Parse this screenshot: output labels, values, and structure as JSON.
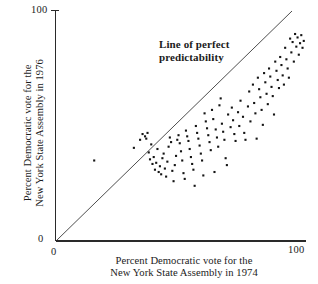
{
  "chart_data": {
    "type": "scatter",
    "title": "",
    "xlabel": "Percent Democratic vote for the New York State Assembly in 1974",
    "ylabel": "Percent Democratic vote for the New York State Assembly in 1976",
    "xlim": [
      0,
      100
    ],
    "ylim": [
      0,
      100
    ],
    "grid": false,
    "legend": false,
    "axis": {
      "x_ticks": [
        "0",
        "100"
      ],
      "x_tick_values": [
        0,
        100
      ],
      "y_ticks": [
        "0",
        "100"
      ],
      "y_tick_values": [
        0,
        100
      ]
    },
    "xlabel_lines": [
      "Percent Democratic vote for the",
      "New York State Assembly in 1974"
    ],
    "ylabel_lines": [
      "Percent Democratic vote for the",
      "New York State Assembly in 1976"
    ],
    "annotations": [
      {
        "text": "Line of perfect predictability",
        "lines": [
          "Line of perfect",
          "predictability"
        ],
        "x": 41,
        "y": 84
      }
    ],
    "reference_line": {
      "name": "line of perfect predictability",
      "type": "identity",
      "slope": 1,
      "intercept": 0,
      "from": [
        0,
        0
      ],
      "to": [
        95,
        100
      ]
    },
    "marker": {
      "shape": "square",
      "color": "#141414",
      "size_px": 2.1
    },
    "n_points": 128,
    "points": [
      [
        15.0,
        35.0
      ],
      [
        31.0,
        40.5
      ],
      [
        33.5,
        44.0
      ],
      [
        34.5,
        46.5
      ],
      [
        35.5,
        45.5
      ],
      [
        36.0,
        44.5
      ],
      [
        36.5,
        47.0
      ],
      [
        37.0,
        38.5
      ],
      [
        37.5,
        35.5
      ],
      [
        38.0,
        42.0
      ],
      [
        38.5,
        33.5
      ],
      [
        39.0,
        36.5
      ],
      [
        39.5,
        31.0
      ],
      [
        40.0,
        34.0
      ],
      [
        40.5,
        40.0
      ],
      [
        41.0,
        30.0
      ],
      [
        41.5,
        32.5
      ],
      [
        42.0,
        29.0
      ],
      [
        42.5,
        36.0
      ],
      [
        43.0,
        38.0
      ],
      [
        43.5,
        31.5
      ],
      [
        44.0,
        28.0
      ],
      [
        44.5,
        34.5
      ],
      [
        45.0,
        41.0
      ],
      [
        45.5,
        45.0
      ],
      [
        46.0,
        43.0
      ],
      [
        46.5,
        30.5
      ],
      [
        47.0,
        26.0
      ],
      [
        47.5,
        33.0
      ],
      [
        48.0,
        37.0
      ],
      [
        48.5,
        44.0
      ],
      [
        49.0,
        46.0
      ],
      [
        49.5,
        42.5
      ],
      [
        50.0,
        39.0
      ],
      [
        50.5,
        35.0
      ],
      [
        51.0,
        29.5
      ],
      [
        51.5,
        27.0
      ],
      [
        52.0,
        48.0
      ],
      [
        52.5,
        45.5
      ],
      [
        53.0,
        43.5
      ],
      [
        53.5,
        40.0
      ],
      [
        54.0,
        36.5
      ],
      [
        54.5,
        33.5
      ],
      [
        55.0,
        31.0
      ],
      [
        55.5,
        24.0
      ],
      [
        56.0,
        50.0
      ],
      [
        56.5,
        47.0
      ],
      [
        57.0,
        44.5
      ],
      [
        57.5,
        41.5
      ],
      [
        58.0,
        38.0
      ],
      [
        58.5,
        35.0
      ],
      [
        59.0,
        28.5
      ],
      [
        59.5,
        55.5
      ],
      [
        60.0,
        52.0
      ],
      [
        60.5,
        49.0
      ],
      [
        61.0,
        46.0
      ],
      [
        61.5,
        43.0
      ],
      [
        62.0,
        39.5
      ],
      [
        62.5,
        57.0
      ],
      [
        63.0,
        53.0
      ],
      [
        63.5,
        30.0
      ],
      [
        64.0,
        48.5
      ],
      [
        64.5,
        45.0
      ],
      [
        65.0,
        41.0
      ],
      [
        65.5,
        59.0
      ],
      [
        66.0,
        62.0
      ],
      [
        66.5,
        51.0
      ],
      [
        67.0,
        47.5
      ],
      [
        67.5,
        44.0
      ],
      [
        68.0,
        36.0
      ],
      [
        68.5,
        33.0
      ],
      [
        69.0,
        55.0
      ],
      [
        70.0,
        49.5
      ],
      [
        70.5,
        58.0
      ],
      [
        71.0,
        52.5
      ],
      [
        71.5,
        46.5
      ],
      [
        72.0,
        43.5
      ],
      [
        73.0,
        56.0
      ],
      [
        73.5,
        50.0
      ],
      [
        74.0,
        61.0
      ],
      [
        75.0,
        54.0
      ],
      [
        75.5,
        47.0
      ],
      [
        76.0,
        44.0
      ],
      [
        77.0,
        58.5
      ],
      [
        77.5,
        65.0
      ],
      [
        78.0,
        52.0
      ],
      [
        79.0,
        68.0
      ],
      [
        79.5,
        60.0
      ],
      [
        80.0,
        55.5
      ],
      [
        80.5,
        44.5
      ],
      [
        81.0,
        71.0
      ],
      [
        81.5,
        66.0
      ],
      [
        82.0,
        62.5
      ],
      [
        82.5,
        57.0
      ],
      [
        83.0,
        50.5
      ],
      [
        83.5,
        73.0
      ],
      [
        84.0,
        69.0
      ],
      [
        84.5,
        64.0
      ],
      [
        85.0,
        59.5
      ],
      [
        85.5,
        75.0
      ],
      [
        86.0,
        71.5
      ],
      [
        86.5,
        67.0
      ],
      [
        87.0,
        63.0
      ],
      [
        87.5,
        55.0
      ],
      [
        88.0,
        78.0
      ],
      [
        88.5,
        74.0
      ],
      [
        89.0,
        70.0
      ],
      [
        89.5,
        66.5
      ],
      [
        90.0,
        80.0
      ],
      [
        90.5,
        76.5
      ],
      [
        91.0,
        72.0
      ],
      [
        91.5,
        68.0
      ],
      [
        92.0,
        84.0
      ],
      [
        92.5,
        79.0
      ],
      [
        93.0,
        75.0
      ],
      [
        93.5,
        71.0
      ],
      [
        94.0,
        88.0
      ],
      [
        94.5,
        82.0
      ],
      [
        95.0,
        86.5
      ],
      [
        95.5,
        78.0
      ],
      [
        96.0,
        90.0
      ],
      [
        96.5,
        84.5
      ],
      [
        97.0,
        88.5
      ],
      [
        97.5,
        81.0
      ],
      [
        98.0,
        86.0
      ],
      [
        98.5,
        89.5
      ],
      [
        99.0,
        84.0
      ],
      [
        99.5,
        87.0
      ]
    ]
  },
  "colors": {
    "background": "#ffffff",
    "axis": "#2a2a2a",
    "marker": "#141414",
    "reference_line": "#3a3a3a",
    "text": "#1b1b1b"
  }
}
